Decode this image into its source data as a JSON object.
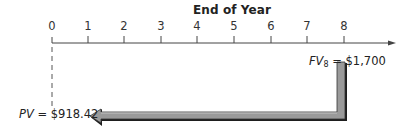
{
  "diagram": {
    "title": "End of Year",
    "timeline": {
      "ticks": [
        "0",
        "1",
        "2",
        "3",
        "4",
        "5",
        "6",
        "7",
        "8"
      ],
      "axis_color": "#444444"
    },
    "future_value": {
      "symbol": "FV",
      "subscript": "8",
      "equals": "=",
      "amount": "$1,700",
      "at_year": "8"
    },
    "present_value": {
      "symbol": "PV",
      "equals": "=",
      "amount": "$918.42",
      "at_year": "0"
    },
    "discount_arrow": {
      "from_year": "8",
      "to_year": "0",
      "fill_color": "#9a9a9a",
      "outline_color": "#222222"
    }
  }
}
